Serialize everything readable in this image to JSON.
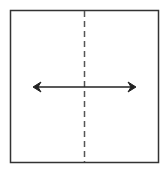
{
  "diagram": {
    "colors": {
      "border": "#333333",
      "dashed_line": "#555555",
      "arrow": "#222222",
      "background": "#ffffff"
    },
    "elements": [
      {
        "type": "square",
        "x": 10,
        "y": 10,
        "width": 148,
        "height": 153
      },
      {
        "type": "dashed-line",
        "orientation": "vertical",
        "x": 84
      },
      {
        "type": "double-arrow",
        "orientation": "horizontal",
        "y": 87,
        "x1": 33,
        "x2": 136
      }
    ]
  }
}
